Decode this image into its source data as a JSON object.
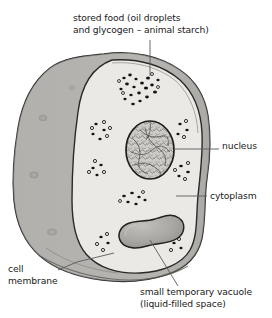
{
  "figure": {
    "background_color": "#ffffff",
    "ink_color": "#1a1a1a",
    "colors": {
      "outer_membrane_fill": "#b4b3b0",
      "outer_membrane_shadow": "#9a9996",
      "cytoplasm_fill": "#ebe9e6",
      "nucleus_fill": "#cdcbc7",
      "vacuole_fill": "#a8a6a2",
      "granule_dark": "#141414",
      "leader_line": "#5a5a5a"
    }
  },
  "labels": {
    "stored_food": {
      "line1": "stored food (oil droplets",
      "line2": "and glycogen – animal starch)"
    },
    "nucleus": "nucleus",
    "cytoplasm": "cytoplasm",
    "cell_membrane": {
      "line1": "cell",
      "line2": "membrane"
    },
    "vacuole": {
      "line1": "small temporary vacuole",
      "line2": "(liquid-filled space)"
    }
  },
  "parts": {
    "cell_body": "cell-body",
    "cytoplasm_region": "cytoplasm-region",
    "nucleus_organelle": "nucleus-organelle",
    "vacuole_organelle": "vacuole-organelle",
    "stored_food_granules": "stored-food-granule-cluster",
    "membrane_edge": "cell-membrane-edge"
  }
}
